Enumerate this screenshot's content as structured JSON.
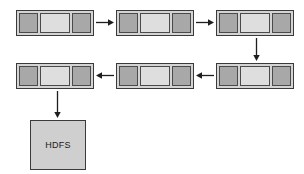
{
  "diagram": {
    "background_color": "#ffffff",
    "colors": {
      "outer_fill": "#d4d4d4",
      "dark_cell_fill": "#a8a8a8",
      "light_cell_fill": "#dedede",
      "store_fill": "#cfcfcf",
      "stroke": "#3a3a3a"
    },
    "nodes": [
      {
        "id": "buffer-1",
        "type": "buffer",
        "label": "",
        "cells": [
          "dark",
          "light",
          "dark"
        ],
        "x": 16,
        "y": 10,
        "w": 78,
        "h": 26
      },
      {
        "id": "buffer-2",
        "type": "buffer",
        "label": "",
        "cells": [
          "dark",
          "light",
          "dark"
        ],
        "x": 116,
        "y": 10,
        "w": 78,
        "h": 26
      },
      {
        "id": "buffer-3",
        "type": "buffer",
        "label": "",
        "cells": [
          "dark",
          "light",
          "dark"
        ],
        "x": 216,
        "y": 10,
        "w": 78,
        "h": 26
      },
      {
        "id": "buffer-4",
        "type": "buffer",
        "label": "",
        "cells": [
          "dark",
          "light",
          "dark"
        ],
        "x": 216,
        "y": 63,
        "w": 78,
        "h": 26
      },
      {
        "id": "buffer-5",
        "type": "buffer",
        "label": "",
        "cells": [
          "dark",
          "light",
          "dark"
        ],
        "x": 116,
        "y": 63,
        "w": 78,
        "h": 26
      },
      {
        "id": "buffer-6",
        "type": "buffer",
        "label": "",
        "cells": [
          "dark",
          "light",
          "dark"
        ],
        "x": 16,
        "y": 63,
        "w": 78,
        "h": 26
      },
      {
        "id": "hdfs-store",
        "type": "store",
        "label": "HDFS",
        "x": 30,
        "y": 120,
        "w": 56,
        "h": 50
      }
    ],
    "arrows": [
      {
        "id": "arrow-1",
        "from": "buffer-1",
        "to": "buffer-2",
        "direction": "right",
        "x": 96,
        "y": 17,
        "length": 18
      },
      {
        "id": "arrow-2",
        "from": "buffer-2",
        "to": "buffer-3",
        "direction": "right",
        "x": 196,
        "y": 17,
        "length": 18
      },
      {
        "id": "arrow-3",
        "from": "buffer-3",
        "to": "buffer-4",
        "direction": "down",
        "x": 251,
        "y": 38,
        "length": 23
      },
      {
        "id": "arrow-4",
        "from": "buffer-4",
        "to": "buffer-5",
        "direction": "left",
        "x": 196,
        "y": 70,
        "length": 18
      },
      {
        "id": "arrow-5",
        "from": "buffer-5",
        "to": "buffer-6",
        "direction": "left",
        "x": 96,
        "y": 70,
        "length": 18
      },
      {
        "id": "arrow-6",
        "from": "buffer-6",
        "to": "hdfs-store",
        "direction": "down",
        "x": 52,
        "y": 91,
        "length": 27
      }
    ]
  }
}
